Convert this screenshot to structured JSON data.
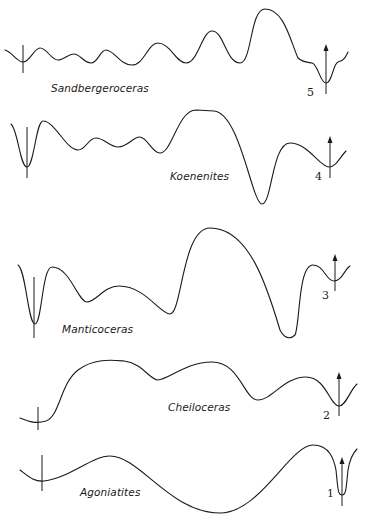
{
  "figure": {
    "stroke_color": "#1a1a1a",
    "background": "#ffffff"
  },
  "sutures": [
    {
      "number": "5",
      "genus": "Sandbergeroceras",
      "path": "M5,50 C12,52 17,62 23,62 C30,62 34,48 40,48 C47,48 51,60 58,60 C64,60 68,54 74,54 C80,54 84,63 91,63 C98,63 100,50 106,50 C114,50 120,65 132,65 C144,65 148,43 158,43 C170,43 176,63 186,63 C198,63 202,31 212,31 C224,31 226,63 240,63 C252,63 250,9 265,9 C284,9 290,40 298,58 C302,62 306,62 312,63 C318,64 320,83 326,83 C332,83 333,64 338,62 C344,61 346,56 348,52",
      "dorsal_marker": {
        "x": 23,
        "y1": 45,
        "y2": 73
      },
      "arrow": {
        "x": 326,
        "y1": 94,
        "y2": 45
      },
      "label_pos": {
        "x": 51,
        "y": 82
      },
      "num_pos": {
        "x": 307,
        "y": 86
      }
    },
    {
      "number": "4",
      "genus": "Koenenites",
      "path": "M11,124 C18,130 20,167 27,167 C34,167 36,121 43,121 C55,121 66,150 78,150 C86,150 88,138 96,138 C104,138 110,147 118,147 C128,147 134,136 140,137 C148,138 152,153 160,153 C172,153 178,110 196,110 L214,111 C240,113 252,204 262,204 C272,204 272,143 290,143 C308,143 320,167 329,167 C336,167 340,157 346,151",
      "dorsal_marker": {
        "x": 27,
        "y1": 127,
        "y2": 178
      },
      "arrow": {
        "x": 330,
        "y1": 178,
        "y2": 137
      },
      "label_pos": {
        "x": 170,
        "y": 170
      },
      "num_pos": {
        "x": 315,
        "y": 170
      }
    },
    {
      "number": "3",
      "genus": "Manticoceras",
      "path": "M18,265 C26,270 28,324 35,324 C42,324 42,267 52,267 C70,267 78,302 87,302 C96,302 104,286 119,286 C145,286 160,314 170,314 C182,314 182,228 210,228 C250,228 268,290 280,330 C284,338 290,340 295,335 C300,325 298,265 313,265 C324,265 326,281 334,281 C342,281 344,270 350,266",
      "dorsal_marker": {
        "x": 34,
        "y1": 277,
        "y2": 338
      },
      "arrow": {
        "x": 335,
        "y1": 290,
        "y2": 255
      },
      "label_pos": {
        "x": 62,
        "y": 323
      },
      "num_pos": {
        "x": 322,
        "y": 289
      }
    },
    {
      "number": "2",
      "genus": "Cheiloceras",
      "path": "M20,418 C30,422 36,424 46,421 C60,416 60,384 78,370 C94,358 112,360 124,361 C142,363 150,380 158,380 C168,380 186,362 212,362 C240,362 244,400 258,400 C272,400 284,377 306,377 C326,377 330,406 339,406 C346,406 350,390 357,384",
      "dorsal_marker": {
        "x": 38,
        "y1": 407,
        "y2": 430
      },
      "arrow": {
        "x": 339,
        "y1": 415,
        "y2": 373
      },
      "label_pos": {
        "x": 168,
        "y": 401
      },
      "num_pos": {
        "x": 323,
        "y": 409
      }
    },
    {
      "number": "1",
      "genus": "Agoniatites",
      "path": "M20,470 C28,476 34,482 44,481 C70,478 92,456 110,456 C140,456 170,513 220,513 C260,513 290,445 313,445 C330,445 334,460 336,470 C338,490 338,495 342,495 C346,495 346,490 348,470 C350,458 354,452 357,449",
      "dorsal_marker": {
        "x": 42,
        "y1": 455,
        "y2": 491
      },
      "arrow": {
        "x": 342,
        "y1": 505,
        "y2": 458
      },
      "label_pos": {
        "x": 80,
        "y": 486
      },
      "num_pos": {
        "x": 327,
        "y": 487
      }
    }
  ]
}
